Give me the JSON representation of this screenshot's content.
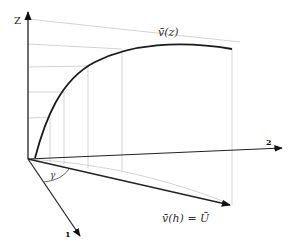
{
  "diagram": {
    "type": "3d-vector-wind-profile",
    "axes": {
      "z_label": "Z",
      "axis1_label": "1",
      "axis2_label": "2"
    },
    "curve_label": "v̄(z)",
    "vector_label": "v̄(h) = Ū",
    "angle_label": "γ",
    "colors": {
      "axis": "#222222",
      "curve": "#1a1a1a",
      "grid": "#c8c8c8",
      "background": "#ffffff"
    }
  }
}
